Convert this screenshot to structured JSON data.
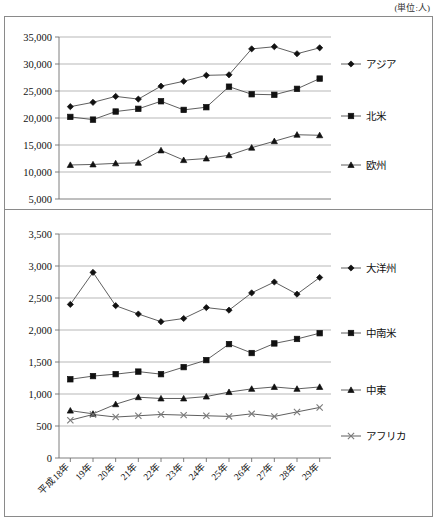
{
  "unit_note": "(単位:人)",
  "chart_data": [
    {
      "type": "line",
      "panel": "top",
      "title": "",
      "xlabel": "",
      "ylabel": "",
      "ylim": [
        5000,
        35000
      ],
      "yticks": [
        5000,
        10000,
        15000,
        20000,
        25000,
        30000,
        35000
      ],
      "ytick_labels": [
        "5,000",
        "10,000",
        "15,000",
        "20,000",
        "25,000",
        "30,000",
        "35,000"
      ],
      "grid": true,
      "legend_position": "right",
      "categories": [
        "平成18年",
        "19年",
        "20年",
        "21年",
        "22年",
        "23年",
        "24年",
        "25年",
        "26年",
        "27年",
        "28年",
        "29年"
      ],
      "series": [
        {
          "name": "アジア",
          "marker": "diamond",
          "values": [
            22100,
            22900,
            24000,
            23500,
            25900,
            26800,
            27900,
            28000,
            32800,
            33200,
            31900,
            33000
          ]
        },
        {
          "name": "北米",
          "marker": "square",
          "values": [
            20200,
            19700,
            21200,
            21700,
            23100,
            21500,
            22000,
            25800,
            24400,
            24300,
            25400,
            27300
          ]
        },
        {
          "name": "欧州",
          "marker": "triangle",
          "values": [
            11300,
            11400,
            11600,
            11700,
            14000,
            12200,
            12500,
            13100,
            14500,
            15700,
            16900,
            16800
          ]
        }
      ]
    },
    {
      "type": "line",
      "panel": "bottom",
      "title": "",
      "xlabel": "",
      "ylabel": "",
      "ylim": [
        0,
        3500
      ],
      "yticks": [
        0,
        500,
        1000,
        1500,
        2000,
        2500,
        3000,
        3500
      ],
      "ytick_labels": [
        "0",
        "500",
        "1,000",
        "1,500",
        "2,000",
        "2,500",
        "3,000",
        "3,500"
      ],
      "grid": true,
      "legend_position": "right",
      "categories": [
        "平成18年",
        "19年",
        "20年",
        "21年",
        "22年",
        "23年",
        "24年",
        "25年",
        "26年",
        "27年",
        "28年",
        "29年"
      ],
      "series": [
        {
          "name": "大洋州",
          "marker": "diamond",
          "values": [
            2400,
            2900,
            2380,
            2250,
            2130,
            2180,
            2350,
            2310,
            2580,
            2750,
            2560,
            2820
          ]
        },
        {
          "name": "中南米",
          "marker": "square",
          "values": [
            1230,
            1280,
            1310,
            1350,
            1310,
            1420,
            1530,
            1780,
            1640,
            1790,
            1860,
            1950
          ]
        },
        {
          "name": "中東",
          "marker": "triangle",
          "values": [
            740,
            690,
            840,
            950,
            930,
            930,
            960,
            1030,
            1080,
            1110,
            1080,
            1110
          ]
        },
        {
          "name": "アフリカ",
          "marker": "x",
          "values": [
            590,
            680,
            640,
            660,
            680,
            670,
            660,
            650,
            690,
            650,
            720,
            790
          ]
        }
      ]
    }
  ]
}
